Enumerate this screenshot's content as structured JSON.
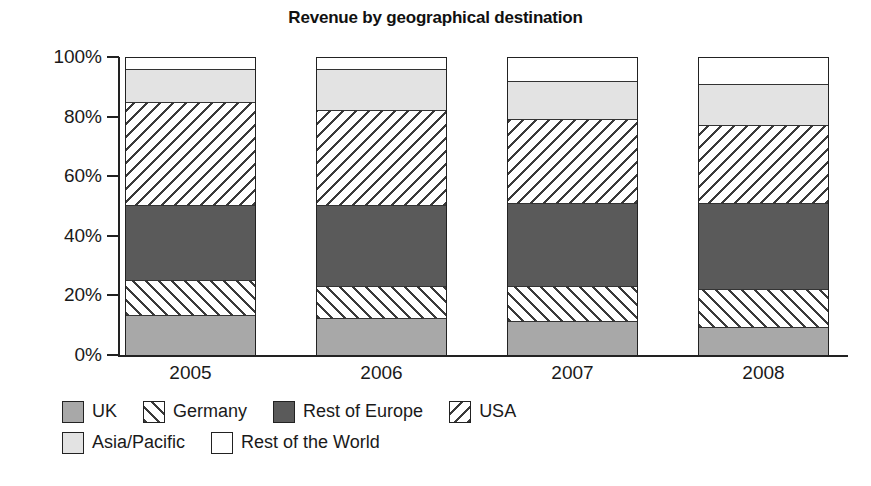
{
  "chart_data": {
    "type": "bar",
    "subtype": "stacked-100-percent",
    "title": "Revenue by geographical destination",
    "xlabel": "",
    "ylabel": "",
    "categories": [
      "2005",
      "2006",
      "2007",
      "2008"
    ],
    "ytick_labels": [
      "100%",
      "80%",
      "60%",
      "40%",
      "20%",
      "0%"
    ],
    "ytick_values": [
      100,
      80,
      60,
      40,
      20,
      0
    ],
    "ylim": [
      0,
      100
    ],
    "grid": false,
    "legend_position": "bottom-left",
    "series": [
      {
        "name": "UK",
        "fill": "solid-mid-gray",
        "color": "#a8a8a8",
        "values": [
          13,
          12,
          11,
          9
        ]
      },
      {
        "name": "Germany",
        "fill": "hatch-forward-slash",
        "color": "#ffffff",
        "values": [
          12,
          11,
          12,
          13
        ]
      },
      {
        "name": "Rest of Europe",
        "fill": "solid-dark-gray",
        "color": "#5a5a5a",
        "values": [
          25,
          27,
          28,
          29
        ]
      },
      {
        "name": "USA",
        "fill": "hatch-back-slash",
        "color": "#ffffff",
        "values": [
          35,
          32,
          28,
          26
        ]
      },
      {
        "name": "Asia/Pacific",
        "fill": "solid-light-gray",
        "color": "#e3e3e3",
        "values": [
          11,
          14,
          13,
          14
        ]
      },
      {
        "name": "Rest of the World",
        "fill": "solid-white",
        "color": "#ffffff",
        "values": [
          4,
          4,
          8,
          9
        ]
      }
    ]
  },
  "legend": {
    "rows": [
      [
        "UK",
        "Germany",
        "Rest of Europe",
        "USA"
      ],
      [
        "Asia/Pacific",
        "Rest of the World"
      ]
    ]
  }
}
